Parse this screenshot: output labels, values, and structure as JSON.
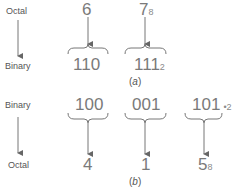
{
  "part_a": {
    "from_label": "Octal",
    "to_label": "Binary",
    "octal_digits": [
      "6",
      "7"
    ],
    "octal_subscript": "8",
    "binary_groups": [
      "110",
      "111"
    ],
    "binary_subscript": "2",
    "caption_letter": "a"
  },
  "part_b": {
    "from_label": "Binary",
    "to_label": "Octal",
    "binary_groups": [
      "100",
      "001",
      "101"
    ],
    "binary_subscript": "2",
    "octal_digits": [
      "4",
      "1",
      "5"
    ],
    "octal_subscript": "8",
    "caption_letter": "b"
  }
}
